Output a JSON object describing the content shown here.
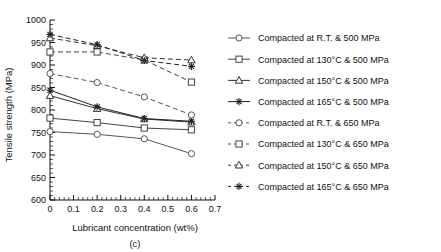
{
  "chart_data": {
    "type": "line",
    "title": "",
    "panel_label": "(c)",
    "xlabel": "Lubricant concentration (wt%)",
    "ylabel": "Tensile strength (MPa)",
    "x": [
      0,
      0.2,
      0.4,
      0.6
    ],
    "xlim": [
      0,
      0.7
    ],
    "ylim": [
      600,
      1000
    ],
    "xticks": [
      "0",
      "0.1",
      "0.2",
      "0.3",
      "0.4",
      "0.5",
      "0.6",
      "0.7"
    ],
    "xtick_values": [
      0,
      0.1,
      0.2,
      0.3,
      0.4,
      0.5,
      0.6,
      0.7
    ],
    "yticks": [
      "600",
      "650",
      "700",
      "750",
      "800",
      "850",
      "900",
      "950",
      "1000"
    ],
    "ytick_values": [
      600,
      650,
      700,
      750,
      800,
      850,
      900,
      950,
      1000
    ],
    "grid": false,
    "legend_position": "right",
    "series": [
      {
        "name": "Compacted at R.T. & 500 MPa",
        "marker": "circle",
        "linestyle": "solid",
        "color": "#555555",
        "values": [
          752,
          746,
          736,
          703
        ]
      },
      {
        "name": "Compacted at 130°C & 500 MPa",
        "marker": "square",
        "linestyle": "solid",
        "color": "#444444",
        "values": [
          782,
          772,
          760,
          756
        ]
      },
      {
        "name": "Compacted at 150°C & 500 MPa",
        "marker": "triangle",
        "linestyle": "solid",
        "color": "#333333",
        "values": [
          832,
          803,
          780,
          773
        ]
      },
      {
        "name": "Compacted at 165°C & 500 MPa",
        "marker": "star",
        "linestyle": "solid",
        "color": "#222222",
        "values": [
          844,
          807,
          781,
          775
        ]
      },
      {
        "name": "Compacted at R.T. & 650 MPa",
        "marker": "circle",
        "linestyle": "dashed",
        "color": "#555555",
        "values": [
          881,
          861,
          829,
          789
        ]
      },
      {
        "name": "Compacted at 130°C & 650 MPa",
        "marker": "square",
        "linestyle": "dashed",
        "color": "#444444",
        "values": [
          929,
          929,
          911,
          862
        ]
      },
      {
        "name": "Compacted at 150°C & 650 MPa",
        "marker": "triangle",
        "linestyle": "dashed",
        "color": "#333333",
        "values": [
          960,
          943,
          916,
          911
        ]
      },
      {
        "name": "Compacted at 165°C & 650 MPa",
        "marker": "star",
        "linestyle": "dashed",
        "color": "#222222",
        "values": [
          968,
          945,
          910,
          897
        ]
      }
    ]
  }
}
